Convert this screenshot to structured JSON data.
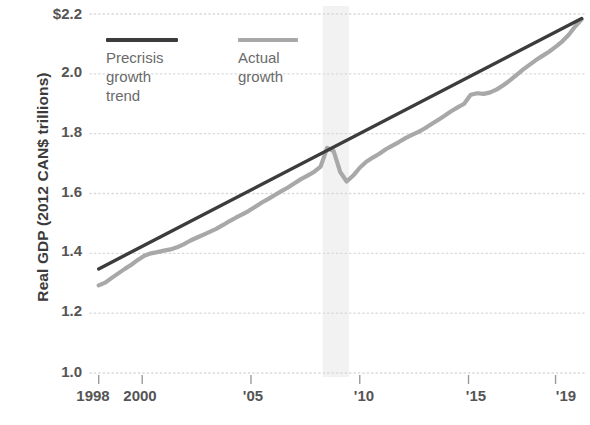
{
  "chart_data": {
    "type": "line",
    "title": "",
    "subtitle": "",
    "xlabel": "",
    "ylabel": "Real GDP (2012 CAN$ trillions)",
    "xlim": [
      1997.6,
      2020.4
    ],
    "ylim": [
      1.0,
      2.2
    ],
    "x_tick_labels": [
      "1998",
      "2000",
      "'05",
      "'10",
      "'15",
      "'19"
    ],
    "x_tick_values": [
      1998,
      2000,
      2005,
      2010,
      2015,
      2019
    ],
    "y_tick_labels": [
      "$2.2",
      "2.0",
      "1.8",
      "1.6",
      "1.4",
      "1.2",
      "1.0"
    ],
    "y_tick_values": [
      2.2,
      2.0,
      1.8,
      1.6,
      1.4,
      1.2,
      1.0
    ],
    "grid": "horizontal-dotted",
    "legend_position": "top-left-inside",
    "colors": {
      "precrisis_trend": "#3c3c3c",
      "actual_growth": "#a8a8a8",
      "grid": "#d9d9d9",
      "axis_text": "#555555",
      "recession_band": "#f2f2f2"
    },
    "annotations": [
      {
        "name": "recession-band",
        "x_start": 2008.3,
        "x_end": 2009.5
      }
    ],
    "series": [
      {
        "name": "Precrisis growth trend",
        "style": "solid-dark",
        "x": [
          1998.0,
          2020.2
        ],
        "values": [
          1.348,
          2.185
        ]
      },
      {
        "name": "Actual growth",
        "style": "solid-gray",
        "x": [
          1998.0,
          1998.3,
          1998.6,
          1998.9,
          1999.2,
          1999.5,
          1999.8,
          2000.1,
          2000.4,
          2000.7,
          2001.0,
          2001.3,
          2001.6,
          2001.9,
          2002.2,
          2002.5,
          2002.8,
          2003.1,
          2003.4,
          2003.7,
          2004.0,
          2004.3,
          2004.6,
          2004.9,
          2005.2,
          2005.5,
          2005.8,
          2006.1,
          2006.4,
          2006.7,
          2007.0,
          2007.3,
          2007.6,
          2007.9,
          2008.2,
          2008.5,
          2008.8,
          2009.1,
          2009.4,
          2009.7,
          2010.0,
          2010.3,
          2010.6,
          2010.9,
          2011.2,
          2011.5,
          2011.8,
          2012.1,
          2012.4,
          2012.7,
          2013.0,
          2013.3,
          2013.6,
          2013.9,
          2014.2,
          2014.5,
          2014.8,
          2015.1,
          2015.4,
          2015.7,
          2016.0,
          2016.3,
          2016.6,
          2016.9,
          2017.2,
          2017.5,
          2017.8,
          2018.1,
          2018.4,
          2018.7,
          2019.0,
          2019.3,
          2019.6,
          2019.9,
          2020.2
        ],
        "values": [
          1.293,
          1.302,
          1.318,
          1.333,
          1.348,
          1.362,
          1.378,
          1.392,
          1.4,
          1.404,
          1.409,
          1.413,
          1.42,
          1.43,
          1.442,
          1.452,
          1.462,
          1.472,
          1.482,
          1.494,
          1.507,
          1.519,
          1.53,
          1.542,
          1.556,
          1.57,
          1.582,
          1.595,
          1.608,
          1.62,
          1.634,
          1.648,
          1.66,
          1.672,
          1.69,
          1.752,
          1.742,
          1.672,
          1.64,
          1.66,
          1.686,
          1.706,
          1.72,
          1.733,
          1.748,
          1.76,
          1.772,
          1.785,
          1.796,
          1.806,
          1.818,
          1.832,
          1.846,
          1.86,
          1.875,
          1.888,
          1.9,
          1.93,
          1.935,
          1.933,
          1.938,
          1.948,
          1.962,
          1.978,
          1.996,
          2.014,
          2.03,
          2.046,
          2.06,
          2.074,
          2.09,
          2.108,
          2.13,
          2.158,
          2.182
        ]
      }
    ]
  },
  "axis": {
    "y_title": "Real GDP (2012 CAN$ trillions)",
    "y_ticks": [
      "$2.2",
      "2.0",
      "1.8",
      "1.6",
      "1.4",
      "1.2",
      "1.0"
    ],
    "x_ticks": [
      "1998",
      "2000",
      "'05",
      "'10",
      "'15",
      "'19"
    ]
  },
  "legend": {
    "items": [
      {
        "label": "Precrisis\ngrowth trend",
        "color": "#3c3c3c"
      },
      {
        "label": "Actual\ngrowth",
        "color": "#a8a8a8"
      }
    ]
  }
}
